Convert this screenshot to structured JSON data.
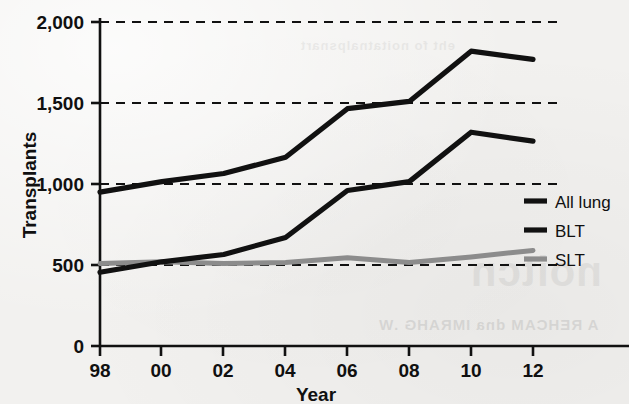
{
  "chart_data": {
    "type": "line",
    "title": "",
    "xlabel": "Year",
    "ylabel": "Transplants",
    "x": [
      1998,
      2000,
      2002,
      2004,
      2006,
      2008,
      2010,
      2012
    ],
    "x_tick_labels": [
      "98",
      "00",
      "02",
      "04",
      "06",
      "08",
      "10",
      "12"
    ],
    "y_tick_labels": [
      "0",
      "500",
      "1,000",
      "1,500",
      "2,000"
    ],
    "y_ticks": [
      0,
      500,
      1000,
      1500,
      2000
    ],
    "ylim": [
      0,
      2000
    ],
    "xlim": [
      1998,
      2012
    ],
    "grid": "horizontal-dashed",
    "legend_position": "right",
    "series": [
      {
        "name": "All lung",
        "color": "#111111",
        "values": [
          950,
          1015,
          1065,
          1165,
          1465,
          1510,
          1820,
          1770
        ]
      },
      {
        "name": "BLT",
        "color": "#111111",
        "values": [
          455,
          520,
          565,
          670,
          960,
          1015,
          1320,
          1265
        ]
      },
      {
        "name": "SLT",
        "color": "#8c8c8c",
        "values": [
          510,
          520,
          510,
          515,
          545,
          515,
          550,
          590
        ]
      }
    ]
  },
  "axes": {
    "y_title": "Transplants",
    "x_title": "Year",
    "y_labels": {
      "t0": "0",
      "t500": "500",
      "t1000": "1,000",
      "t1500": "1,500",
      "t2000": "2,000"
    },
    "x_labels": {
      "l98": "98",
      "l00": "00",
      "l02": "02",
      "l04": "04",
      "l06": "06",
      "l08": "08",
      "l10": "10",
      "l12": "12"
    }
  },
  "legend": {
    "items": [
      {
        "label": "All lung",
        "color": "#111111",
        "thickness": "thick"
      },
      {
        "label": "BLT",
        "color": "#111111",
        "thickness": "thick"
      },
      {
        "label": "SLT",
        "color": "#8c8c8c",
        "thickness": "thick"
      }
    ]
  },
  "background": {
    "paper_color": "#f2f1ef",
    "ink_color": "#111111",
    "gray_series_color": "#8c8c8c",
    "bleed_text_main": "noitcn",
    "bleed_text_sub": "A REHCAM dna IMRAHG .W",
    "bleed_text_top": "eht fo noitatnalpsnart"
  }
}
